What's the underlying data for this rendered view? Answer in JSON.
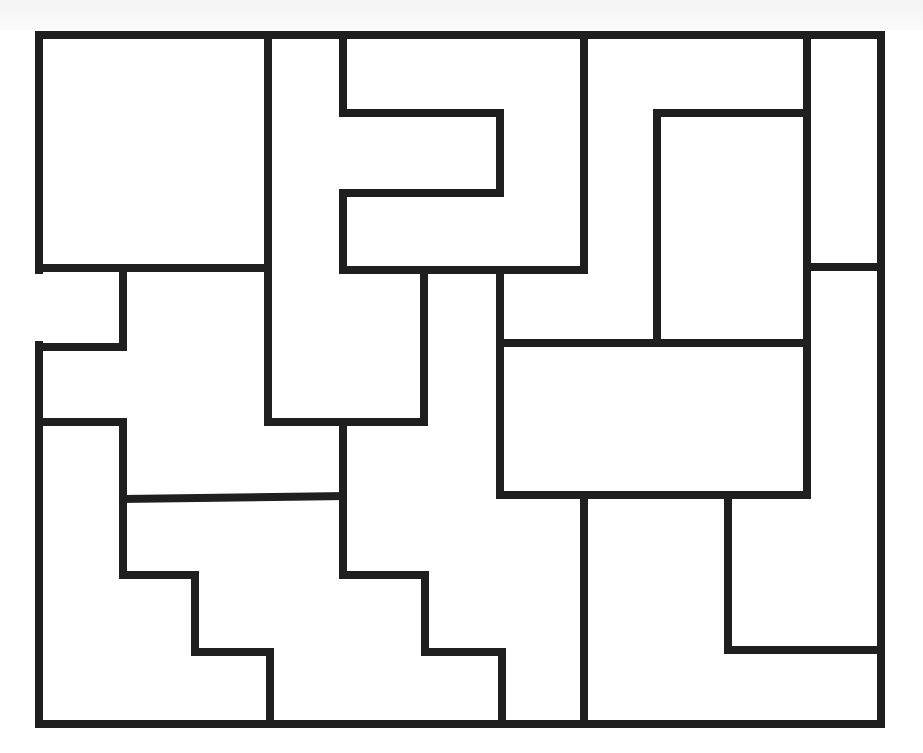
{
  "diagram": {
    "type": "maze-puzzle",
    "canvas": {
      "width": 923,
      "height": 753
    },
    "stroke": {
      "color": "#1f1f1f",
      "width": 8
    },
    "background": "#ffffff",
    "walls": [
      {
        "name": "outer-top",
        "x1": 39,
        "y1": 35,
        "x2": 881,
        "y2": 35
      },
      {
        "name": "outer-right",
        "x1": 881,
        "y1": 35,
        "x2": 881,
        "y2": 724
      },
      {
        "name": "outer-bottom",
        "x1": 39,
        "y1": 724,
        "x2": 881,
        "y2": 724
      },
      {
        "name": "outer-left-upper",
        "x1": 39,
        "y1": 35,
        "x2": 39,
        "y2": 270
      },
      {
        "name": "outer-left-lower",
        "x1": 39,
        "y1": 345,
        "x2": 39,
        "y2": 724
      },
      {
        "name": "w1",
        "x1": 39,
        "y1": 268,
        "x2": 268,
        "y2": 268
      },
      {
        "name": "w2",
        "x1": 268,
        "y1": 35,
        "x2": 268,
        "y2": 422
      },
      {
        "name": "w3",
        "x1": 268,
        "y1": 422,
        "x2": 424,
        "y2": 422
      },
      {
        "name": "w4",
        "x1": 424,
        "y1": 270,
        "x2": 424,
        "y2": 422
      },
      {
        "name": "w5",
        "x1": 343,
        "y1": 35,
        "x2": 343,
        "y2": 113
      },
      {
        "name": "w6",
        "x1": 343,
        "y1": 113,
        "x2": 500,
        "y2": 113
      },
      {
        "name": "w7",
        "x1": 500,
        "y1": 113,
        "x2": 500,
        "y2": 193
      },
      {
        "name": "w8",
        "x1": 343,
        "y1": 193,
        "x2": 500,
        "y2": 193
      },
      {
        "name": "w9",
        "x1": 343,
        "y1": 193,
        "x2": 343,
        "y2": 270
      },
      {
        "name": "w10",
        "x1": 343,
        "y1": 270,
        "x2": 584,
        "y2": 270
      },
      {
        "name": "w11",
        "x1": 584,
        "y1": 35,
        "x2": 584,
        "y2": 270
      },
      {
        "name": "w12",
        "x1": 807,
        "y1": 35,
        "x2": 807,
        "y2": 495
      },
      {
        "name": "w13",
        "x1": 657,
        "y1": 113,
        "x2": 807,
        "y2": 113
      },
      {
        "name": "w14",
        "x1": 657,
        "y1": 113,
        "x2": 657,
        "y2": 343
      },
      {
        "name": "w15",
        "x1": 807,
        "y1": 267,
        "x2": 881,
        "y2": 267
      },
      {
        "name": "w16",
        "x1": 500,
        "y1": 270,
        "x2": 500,
        "y2": 495
      },
      {
        "name": "w17",
        "x1": 500,
        "y1": 343,
        "x2": 807,
        "y2": 343
      },
      {
        "name": "w18",
        "x1": 500,
        "y1": 495,
        "x2": 807,
        "y2": 495
      },
      {
        "name": "w19",
        "x1": 123,
        "y1": 270,
        "x2": 123,
        "y2": 347
      },
      {
        "name": "w20",
        "x1": 39,
        "y1": 347,
        "x2": 123,
        "y2": 347
      },
      {
        "name": "w21",
        "x1": 39,
        "y1": 422,
        "x2": 123,
        "y2": 422
      },
      {
        "name": "w22",
        "x1": 123,
        "y1": 422,
        "x2": 123,
        "y2": 575
      },
      {
        "name": "w23",
        "x1": 123,
        "y1": 575,
        "x2": 195,
        "y2": 575
      },
      {
        "name": "w24",
        "x1": 195,
        "y1": 575,
        "x2": 195,
        "y2": 652
      },
      {
        "name": "w25",
        "x1": 195,
        "y1": 652,
        "x2": 270,
        "y2": 652
      },
      {
        "name": "w26",
        "x1": 270,
        "y1": 652,
        "x2": 270,
        "y2": 724
      },
      {
        "name": "w27",
        "x1": 123,
        "y1": 499,
        "x2": 343,
        "y2": 496
      },
      {
        "name": "w28",
        "x1": 343,
        "y1": 422,
        "x2": 343,
        "y2": 575
      },
      {
        "name": "w29",
        "x1": 343,
        "y1": 575,
        "x2": 425,
        "y2": 575
      },
      {
        "name": "w30",
        "x1": 425,
        "y1": 575,
        "x2": 425,
        "y2": 652
      },
      {
        "name": "w31",
        "x1": 425,
        "y1": 652,
        "x2": 502,
        "y2": 652
      },
      {
        "name": "w32",
        "x1": 502,
        "y1": 652,
        "x2": 502,
        "y2": 724
      },
      {
        "name": "w33",
        "x1": 584,
        "y1": 495,
        "x2": 584,
        "y2": 724
      },
      {
        "name": "w34",
        "x1": 728,
        "y1": 495,
        "x2": 728,
        "y2": 650
      },
      {
        "name": "w35",
        "x1": 728,
        "y1": 650,
        "x2": 881,
        "y2": 650
      }
    ],
    "openings": [
      {
        "name": "left-entrance",
        "side": "left",
        "x": 39,
        "y_from": 270,
        "y_to": 345
      }
    ]
  }
}
